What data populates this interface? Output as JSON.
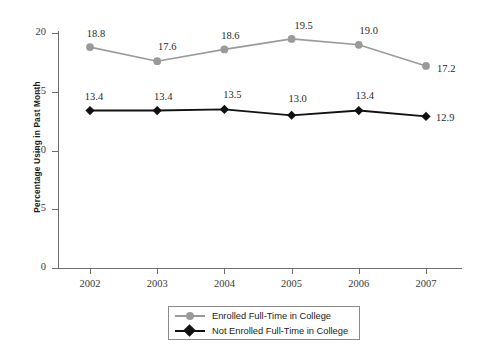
{
  "chart_data": {
    "type": "line",
    "title": "",
    "subtitle": "",
    "xlabel": "",
    "ylabel": "Percentage Using in Past Month",
    "categories": [
      "2002",
      "2003",
      "2004",
      "2005",
      "2006",
      "2007"
    ],
    "x": [
      2002,
      2003,
      2004,
      2005,
      2006,
      2007
    ],
    "ylim": [
      0,
      20
    ],
    "yticks": [
      0,
      5,
      10,
      15,
      20
    ],
    "ytick_labels": [
      "0",
      "5",
      "10",
      "15",
      "20"
    ],
    "grid": false,
    "legend_position": "bottom-center",
    "series": [
      {
        "name": "Enrolled Full-Time in College",
        "color": "#9a9a9a",
        "marker": "circle",
        "values": [
          18.8,
          17.6,
          18.6,
          19.5,
          19.0,
          17.2
        ],
        "labels": [
          "18.8",
          "17.6",
          "18.6",
          "19.5",
          "19.0",
          "17.2"
        ]
      },
      {
        "name": "Not Enrolled Full-Time in College",
        "color": "#111111",
        "marker": "diamond",
        "values": [
          13.4,
          13.4,
          13.5,
          13.0,
          13.4,
          12.9
        ],
        "labels": [
          "13.4",
          "13.4",
          "13.5",
          "13.0",
          "13.4",
          "12.9"
        ]
      }
    ]
  },
  "axes": {
    "y_title": "Percentage Using in Past Month",
    "y_tick_labels": [
      "20",
      "15",
      "10",
      "5",
      "0"
    ],
    "x_tick_labels": [
      "2002",
      "2003",
      "2004",
      "2005",
      "2006",
      "2007"
    ]
  },
  "legend": {
    "items": [
      {
        "label": "Enrolled Full-Time in College",
        "color": "#9a9a9a",
        "marker": "circle-icon"
      },
      {
        "label": "Not Enrolled Full-Time in College",
        "color": "#111111",
        "marker": "diamond-icon"
      }
    ]
  },
  "point_labels": {
    "enrolled": [
      "18.8",
      "17.6",
      "18.6",
      "19.5",
      "19.0",
      "17.2"
    ],
    "not_enrolled": [
      "13.4",
      "13.4",
      "13.5",
      "13.0",
      "13.4",
      "12.9"
    ]
  },
  "colors": {
    "series_enrolled": "#9a9a9a",
    "series_not_enrolled": "#111111",
    "axis": "#6e6e6e",
    "background": "#ffffff"
  }
}
